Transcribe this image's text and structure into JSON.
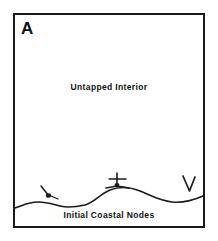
{
  "figure": {
    "panel_letter": "A",
    "interior_label": "Untapped  Interior",
    "coastal_label": "Initial Coastal Nodes",
    "stroke_color": "#1a1a1a",
    "text_color": "#111111",
    "background_color": "#ffffff"
  },
  "diagram_data": {
    "type": "schematic-map",
    "title": "A",
    "regions": [
      {
        "name": "untapped-interior",
        "label": "Untapped  Interior",
        "description": "Large empty area occupying the upper portion of the framed panel"
      },
      {
        "name": "coastal-strip",
        "label": "Initial Coastal Nodes",
        "description": "Narrow band below the wavy coastline curve at the bottom of the panel"
      }
    ],
    "coastline": {
      "name": "coastline-curve",
      "description": "Single wavy line running left to right across the lower panel",
      "start_point": [
        15,
        208
      ],
      "end_point": [
        203,
        196
      ],
      "waypoints": [
        [
          15,
          208
        ],
        [
          32,
          203
        ],
        [
          50,
          202
        ],
        [
          70,
          207
        ],
        [
          88,
          205
        ],
        [
          108,
          191
        ],
        [
          128,
          188
        ],
        [
          150,
          194
        ],
        [
          172,
          202
        ],
        [
          190,
          200
        ],
        [
          203,
          196
        ]
      ]
    },
    "nodes": [
      {
        "name": "coastal-node-left",
        "glyph": "anchor-icon",
        "x": 47,
        "y": 193
      },
      {
        "name": "coastal-node-center",
        "glyph": "anchor-icon",
        "x": 117,
        "y": 180
      },
      {
        "name": "coastal-node-right",
        "glyph": "gull-icon",
        "x": 189,
        "y": 184
      }
    ],
    "frame": {
      "x": 13,
      "y": 13,
      "width": 192,
      "height": 215
    }
  }
}
